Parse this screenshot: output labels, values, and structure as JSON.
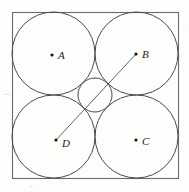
{
  "figure": {
    "background_color": "#fdfdfc",
    "stroke_color": "#4a4a4a",
    "label_color": "#1a1a1a"
  },
  "chart_data": {
    "type": "diagram",
    "title": "",
    "xlabel": "",
    "ylabel": "",
    "grid": false,
    "legend": null,
    "square": {
      "label": "square",
      "x": 12,
      "y": 12,
      "side": 166
    },
    "circles": [
      {
        "label": "A",
        "cx": 53.5,
        "cy": 53.5,
        "r": 41.5
      },
      {
        "label": "B",
        "cx": 136.5,
        "cy": 53.5,
        "r": 41.5
      },
      {
        "label": "C",
        "cx": 136.5,
        "cy": 136.5,
        "r": 41.5
      },
      {
        "label": "D",
        "cx": 53.5,
        "cy": 136.5,
        "r": 41.5
      }
    ],
    "center_circle": {
      "label": "",
      "cx": 95.0,
      "cy": 95.0,
      "r": 17.0
    },
    "points": [
      {
        "name": "A",
        "x": 52,
        "y": 55,
        "label_x": 58,
        "label_y": 59
      },
      {
        "name": "B",
        "x": 136,
        "y": 54,
        "label_x": 142,
        "label_y": 58
      },
      {
        "name": "C",
        "x": 136,
        "y": 140,
        "label_x": 142,
        "label_y": 145
      },
      {
        "name": "D",
        "x": 56,
        "y": 140,
        "label_x": 62,
        "label_y": 147
      }
    ],
    "segments": [
      {
        "name": "DB",
        "from": "D",
        "to": "B",
        "x1": 56,
        "y1": 140,
        "x2": 136,
        "y2": 54
      }
    ]
  },
  "labels": {
    "a": "A",
    "b": "B",
    "c": "C",
    "d": "D"
  }
}
